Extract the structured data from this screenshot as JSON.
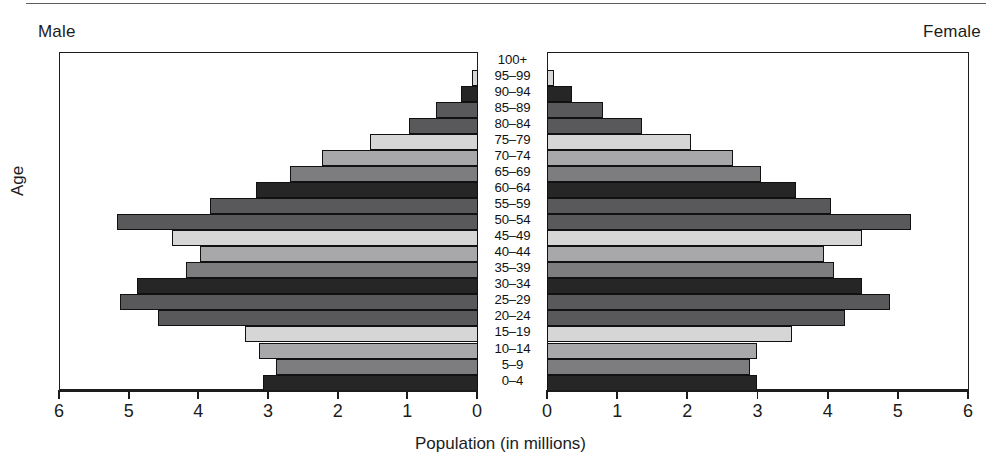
{
  "figure": {
    "male_label": "Male",
    "female_label": "Female",
    "y_axis_title": "Age",
    "x_axis_title": "Population (in millions)"
  },
  "axis": {
    "left_tick_labels": [
      "6",
      "5",
      "4",
      "3",
      "2",
      "1",
      "0"
    ],
    "right_tick_labels": [
      "0",
      "1",
      "2",
      "3",
      "4",
      "5",
      "6"
    ],
    "max": 6,
    "min": 0,
    "unit": "millions"
  },
  "colors": {
    "frame": "#1c1c1c",
    "text": "#1c1c1c",
    "shade_black": "#262626",
    "shade_dark": "#59595b",
    "shade_mid": "#7d7d7f",
    "shade_light": "#a8a8aa",
    "shade_pale": "#d6d6d6",
    "background": "#ffffff"
  },
  "chart_data": {
    "type": "bar",
    "subtype": "population-pyramid",
    "title": "",
    "xlabel": "Population (in millions)",
    "ylabel": "Age",
    "xlim": [
      0,
      6
    ],
    "grid": false,
    "legend": "none",
    "orientation": "horizontal",
    "categories": [
      "100+",
      "95–99",
      "90–94",
      "85–89",
      "80–84",
      "75–79",
      "70–74",
      "65–69",
      "60–64",
      "55–59",
      "50–54",
      "45–49",
      "40–44",
      "35–39",
      "30–34",
      "25–29",
      "20–24",
      "15–19",
      "10–14",
      "5–9",
      "0–4"
    ],
    "series": [
      {
        "name": "Male",
        "direction": "left",
        "values": [
          0.0,
          0.08,
          0.25,
          0.6,
          1.0,
          1.55,
          2.25,
          2.7,
          3.2,
          3.85,
          5.2,
          4.4,
          4.0,
          4.2,
          4.9,
          5.15,
          4.6,
          3.35,
          3.15,
          2.9,
          3.1
        ]
      },
      {
        "name": "Female",
        "direction": "right",
        "values": [
          0.0,
          0.1,
          0.35,
          0.8,
          1.35,
          2.05,
          2.65,
          3.05,
          3.55,
          4.05,
          5.2,
          4.5,
          3.95,
          4.1,
          4.5,
          4.9,
          4.25,
          3.5,
          3.0,
          2.9,
          3.0
        ]
      }
    ],
    "shade_pattern": [
      "shade_pale",
      "shade_pale",
      "shade_black",
      "shade_dark",
      "shade_dark",
      "shade_pale",
      "shade_light",
      "shade_mid",
      "shade_black",
      "shade_dark",
      "shade_dark",
      "shade_pale",
      "shade_light",
      "shade_mid",
      "shade_black",
      "shade_dark",
      "shade_dark",
      "shade_pale",
      "shade_light",
      "shade_mid",
      "shade_black"
    ]
  }
}
